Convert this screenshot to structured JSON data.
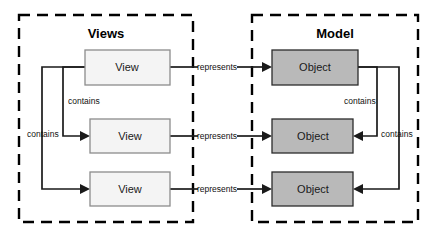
{
  "diagram": {
    "groups": [
      {
        "id": "views",
        "label": "Views"
      },
      {
        "id": "model",
        "label": "Model"
      }
    ],
    "view_nodes": [
      {
        "label": "View"
      },
      {
        "label": "View"
      },
      {
        "label": "View"
      }
    ],
    "object_nodes": [
      {
        "label": "Object"
      },
      {
        "label": "Object"
      },
      {
        "label": "Object"
      }
    ],
    "represents_labels": [
      "represents",
      "represents",
      "represents"
    ],
    "contains_labels_left": [
      "contains",
      "contains"
    ],
    "contains_labels_right": [
      "contains",
      "contains"
    ],
    "colors": {
      "background": "#ffffff",
      "container_stroke": "#000000",
      "view_fill": "#f4f4f4",
      "view_stroke": "#8c8c8c",
      "object_fill": "#b9b9b9",
      "object_stroke": "#2b2b2b",
      "connector": "#1a1a1a",
      "text": "#000000"
    }
  }
}
